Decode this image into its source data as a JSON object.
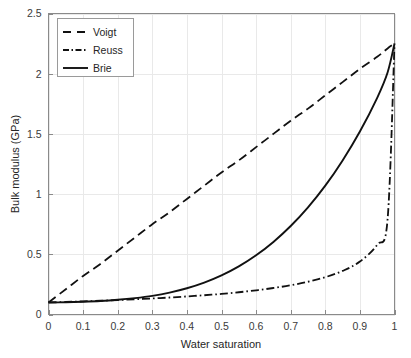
{
  "figure": {
    "background_color": "#ffffff",
    "foreground_color": "#262626",
    "grid_color": "#e9e9e9",
    "axis_color": "#8a8a8a"
  },
  "chart_data": {
    "type": "line",
    "title": "",
    "subtitle": "",
    "xlabel": "Water saturation",
    "ylabel": "Bulk modulus (GPa)",
    "xlim": [
      0,
      1
    ],
    "ylim": [
      0,
      2.5
    ],
    "xticks": [
      0,
      0.1,
      0.2,
      0.3,
      0.4,
      0.5,
      0.6,
      0.7,
      0.8,
      0.9,
      1
    ],
    "xtick_labels": [
      "0",
      "0.1",
      "0.2",
      "0.3",
      "0.4",
      "0.5",
      "0.6",
      "0.7",
      "0.8",
      "0.9",
      "1"
    ],
    "yticks": [
      0,
      0.5,
      1,
      1.5,
      2,
      2.5
    ],
    "ytick_labels": [
      "0",
      "0.5",
      "1",
      "1.5",
      "2",
      "2.5"
    ],
    "grid": true,
    "legend_position": "upper left",
    "x": [
      0,
      0.05,
      0.1,
      0.15,
      0.2,
      0.25,
      0.3,
      0.35,
      0.4,
      0.45,
      0.5,
      0.55,
      0.6,
      0.65,
      0.7,
      0.75,
      0.8,
      0.85,
      0.9,
      0.95,
      0.98,
      1
    ],
    "series": [
      {
        "name": "Voigt",
        "style": "dashed",
        "color": "#111111",
        "values": [
          0.1,
          0.21,
          0.32,
          0.42,
          0.53,
          0.64,
          0.75,
          0.85,
          0.96,
          1.07,
          1.18,
          1.28,
          1.39,
          1.5,
          1.61,
          1.71,
          1.82,
          1.93,
          2.04,
          2.14,
          2.21,
          2.25
        ]
      },
      {
        "name": "Reuss",
        "style": "dash-dot",
        "color": "#111111",
        "values": [
          0.1,
          0.104,
          0.109,
          0.114,
          0.12,
          0.126,
          0.133,
          0.141,
          0.15,
          0.16,
          0.171,
          0.185,
          0.201,
          0.22,
          0.243,
          0.272,
          0.31,
          0.362,
          0.44,
          0.58,
          0.79,
          2.25
        ]
      },
      {
        "name": "Brie",
        "style": "solid",
        "color": "#111111",
        "values": [
          0.1,
          0.102,
          0.106,
          0.112,
          0.122,
          0.136,
          0.155,
          0.182,
          0.218,
          0.265,
          0.325,
          0.4,
          0.492,
          0.603,
          0.735,
          0.89,
          1.07,
          1.28,
          1.52,
          1.8,
          2.01,
          2.25
        ]
      }
    ]
  },
  "legend": {
    "items": [
      {
        "label": "Voigt",
        "style": "dashed"
      },
      {
        "label": "Reuss",
        "style": "dash-dot"
      },
      {
        "label": "Brie",
        "style": "solid"
      }
    ]
  }
}
